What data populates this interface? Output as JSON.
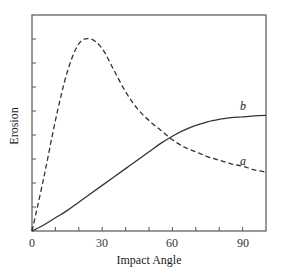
{
  "chart_data": {
    "type": "line",
    "title": "",
    "xlabel": "Impact Angle",
    "ylabel": "Erosion",
    "xlim": [
      0,
      100
    ],
    "ylim": [
      0,
      9
    ],
    "xticks": [
      0,
      10,
      20,
      30,
      40,
      50,
      60,
      70,
      80,
      90
    ],
    "xtick_labels": [
      "0",
      "30",
      "60",
      "90"
    ],
    "xtick_label_values": [
      0,
      30,
      60,
      90
    ],
    "yticks": [
      1,
      2,
      3,
      4,
      5,
      6,
      7,
      8
    ],
    "ytick_labels": [],
    "grid": false,
    "legend": "inline labels",
    "series": [
      {
        "name": "a",
        "style": "dashed",
        "x": [
          0,
          5,
          10,
          15,
          20,
          25,
          30,
          35,
          40,
          45,
          50,
          55,
          60,
          65,
          70,
          75,
          80,
          85,
          90,
          95,
          100
        ],
        "values": [
          0,
          2.2,
          4.6,
          6.6,
          7.8,
          8.0,
          7.6,
          6.7,
          5.8,
          5.1,
          4.6,
          4.2,
          3.8,
          3.5,
          3.3,
          3.1,
          2.95,
          2.8,
          2.7,
          2.55,
          2.45
        ]
      },
      {
        "name": "b",
        "style": "solid",
        "x": [
          0,
          5,
          10,
          15,
          20,
          25,
          30,
          35,
          40,
          45,
          50,
          55,
          60,
          65,
          70,
          75,
          80,
          85,
          90,
          95,
          100
        ],
        "values": [
          0,
          0.25,
          0.55,
          0.85,
          1.2,
          1.55,
          1.9,
          2.25,
          2.6,
          2.95,
          3.3,
          3.65,
          3.95,
          4.2,
          4.4,
          4.55,
          4.65,
          4.72,
          4.76,
          4.8,
          4.82
        ]
      }
    ],
    "annotations": [
      {
        "text": "a",
        "x": 89,
        "y": 2.85
      },
      {
        "text": "b",
        "x": 89,
        "y": 5.05
      }
    ]
  },
  "labels": {
    "xlabel": "Impact Angle",
    "ylabel": "Erosion",
    "series_a": "a",
    "series_b": "b",
    "xtick_0": "0",
    "xtick_30": "30",
    "xtick_60": "60",
    "xtick_90": "90"
  }
}
